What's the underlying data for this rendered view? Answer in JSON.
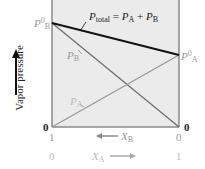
{
  "diagram": {
    "y_axis_label": "Vapor pressure",
    "total_label_main": "P",
    "total_label_sub": "total",
    "total_label_eq": " = ",
    "total_pa": "P",
    "total_pa_sub": "A",
    "total_plus": " + ",
    "total_pb": "P",
    "total_pb_sub": "B",
    "pb0_main": "P",
    "pb0_sup": "0",
    "pb0_sub": "B",
    "pa0_main": "P",
    "pa0_sup": "0",
    "pa0_sub": "A",
    "pb_line_main": "P",
    "pb_line_sub": "B",
    "pa_line_main": "P",
    "pa_line_sub": "A",
    "left_zero": "0",
    "right_zero": "0",
    "xb_left": "1",
    "xb_right": "0",
    "xb_label": "X",
    "xb_sub": "B",
    "xa_left": "0",
    "xa_right": "1",
    "xa_label": "X",
    "xa_sub": "A",
    "colors": {
      "background": "#ebebeb",
      "total_line": "#111111",
      "pb_line": "#6e6e6e",
      "pa_line": "#9a9a9a"
    }
  }
}
